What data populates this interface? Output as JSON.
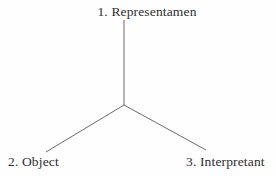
{
  "diagram": {
    "type": "triadic-y-diagram",
    "background_color": "#fefefe",
    "line_color": "#6b6b6b",
    "text_color": "#2e2e2e",
    "nodes": [
      {
        "id": "representamen",
        "label": "1. Representamen",
        "position": "top"
      },
      {
        "id": "object",
        "label": "2. Object",
        "position": "bottom-left"
      },
      {
        "id": "interpretant",
        "label": "3. Interpretant",
        "position": "bottom-right"
      }
    ],
    "edges": [
      {
        "id": "stem-top",
        "from": "center",
        "to": "representamen",
        "x1": 124,
        "y1": 105,
        "x2": 124,
        "y2": 20
      },
      {
        "id": "arm-left",
        "from": "center",
        "to": "object",
        "x1": 124,
        "y1": 105,
        "x2": 46,
        "y2": 152
      },
      {
        "id": "arm-right",
        "from": "center",
        "to": "interpretant",
        "x1": 124,
        "y1": 105,
        "x2": 206,
        "y2": 150
      }
    ],
    "junction": {
      "x": 124,
      "y": 105
    }
  }
}
